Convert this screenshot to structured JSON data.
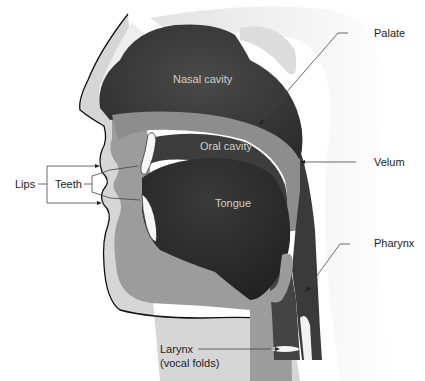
{
  "diagram": {
    "colors": {
      "background": "#ffffff",
      "skin_outline": "#111111",
      "light_tissue": "#d4d4d4",
      "mid_tissue": "#9b9b9b",
      "palate_band": "#8a8a8a",
      "dark_cavity": "#3a3a3a",
      "tongue": "#2e2e2e",
      "back_shadow": "#e6e6e6",
      "leader_line": "#444444",
      "label_text": "#222222",
      "internal_label_text": "#cfcfcf"
    },
    "internal_labels": {
      "nasal_cavity": "Nasal cavity",
      "oral_cavity": "Oral cavity",
      "tongue": "Tongue"
    },
    "callouts": {
      "palate": "Palate",
      "velum": "Velum",
      "pharynx": "Pharynx",
      "lips": "Lips",
      "teeth": "Teeth",
      "larynx_line1": "Larynx",
      "larynx_line2": "(vocal folds)"
    }
  }
}
